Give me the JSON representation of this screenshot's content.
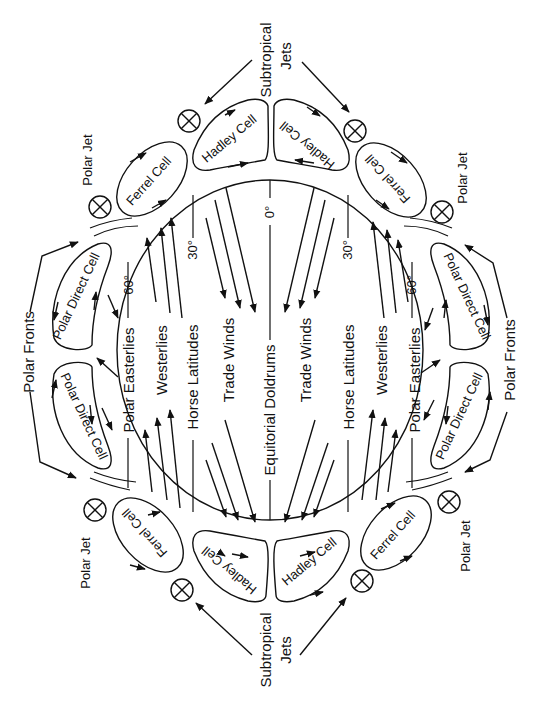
{
  "diagram": {
    "bands": {
      "polar_easterlies_left": "Polar Easterlies",
      "westerlies_left": "Westerlies",
      "horse_latitudes_left": "Horse Latitudes",
      "trade_winds_left": "Trade Winds",
      "doldrums": "Equitorial Doldrums",
      "trade_winds_right": "Trade Winds",
      "horse_latitudes_right": "Horse Latitudes",
      "westerlies_right": "Westerlies",
      "polar_easterlies_right": "Polar Easterlies"
    },
    "latitudes": {
      "lat60_left": "60°",
      "lat30_left": "30°",
      "lat0": "0°",
      "lat30_right": "30°",
      "lat60_right": "60°"
    },
    "cells": {
      "hadley": "Hadley Cell",
      "ferrel": "Ferrel Cell",
      "ferrel_alt": "Ferrel Cell",
      "polar_direct": "Polar Direct Cell"
    },
    "outer_labels": {
      "subtropical_top": "Subtropical",
      "jets_top": "Jets",
      "subtropical_bottom": "Subtropical",
      "jets_bottom": "Jets",
      "polar_jet_tl": "Polar Jet",
      "polar_jet_tr": "Polar Jet",
      "polar_jet_bl": "Polar Jet",
      "polar_jet_br": "Polar Jet",
      "polar_fronts_left": "Polar Fronts",
      "polar_fronts_right": "Polar Fronts"
    },
    "colors": {
      "ink": "#111111",
      "background": "#ffffff"
    }
  }
}
